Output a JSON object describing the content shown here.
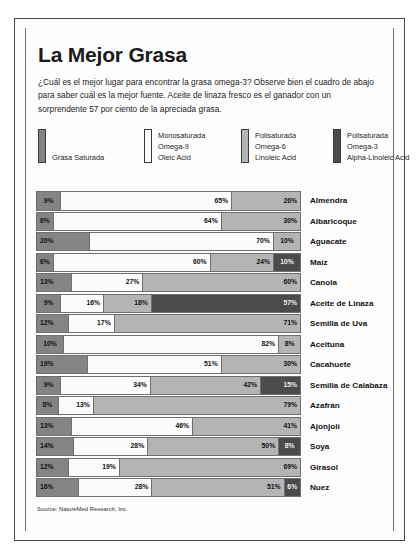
{
  "poster": {
    "title": "La Mejor Grasa",
    "deck": "¿Cuál es el mejor lugar para encontrar la grasa omega-3? Observe bien el cuadro de abajo para saber cuál es la mejor fuente. Aceite de linaza fresco es el ganador con un sorprendente 57 por ciento de la apreciada grasa.",
    "source": "Source: NatureMed Research, Inc."
  },
  "legend": [
    {
      "key": "saturada",
      "color": "#848484",
      "lines": [
        "Grasa Saturada"
      ]
    },
    {
      "key": "omega9",
      "color": "#fbfbfb",
      "lines": [
        "Monosaturada",
        "Omega-9",
        "Oleic Acid"
      ]
    },
    {
      "key": "omega6",
      "color": "#b4b4b4",
      "lines": [
        "Polisaturada",
        "Omega-6",
        "Linoleic Acid"
      ]
    },
    {
      "key": "omega3",
      "color": "#4b4b4b",
      "lines": [
        "Polisaturada",
        "Omega-3",
        "Alpha-Linoleic Acid"
      ]
    }
  ],
  "chart_data": {
    "type": "bar",
    "subtype": "stacked-horizontal-100",
    "title": "La Mejor Grasa",
    "xlabel": "",
    "ylabel": "",
    "xlim": [
      0,
      100
    ],
    "grid": false,
    "legend_position": "top",
    "categories": [
      "Almendra",
      "Albaricoque",
      "Aguacate",
      "Maíz",
      "Canola",
      "Aceite de Linaza",
      "Semilla de Uva",
      "Aceituna",
      "Cacahuete",
      "Semilla de Calabaza",
      "Azafrán",
      "Ajonjolí",
      "Soya",
      "Girasol",
      "Nuez"
    ],
    "series": [
      {
        "name": "Grasa Saturada",
        "key": "saturada",
        "color": "#848484",
        "values": [
          9,
          6,
          20,
          6,
          13,
          9,
          12,
          10,
          19,
          9,
          8,
          13,
          14,
          12,
          16
        ]
      },
      {
        "name": "Monosaturada Omega-9",
        "key": "omega9",
        "color": "#fbfbfb",
        "values": [
          65,
          64,
          70,
          60,
          27,
          16,
          17,
          82,
          51,
          34,
          13,
          46,
          28,
          19,
          28
        ]
      },
      {
        "name": "Polisaturada Omega-6",
        "key": "omega6",
        "color": "#b4b4b4",
        "values": [
          26,
          30,
          10,
          24,
          60,
          18,
          71,
          8,
          30,
          42,
          79,
          41,
          50,
          69,
          51
        ]
      },
      {
        "name": "Polisaturada Omega-3",
        "key": "omega3",
        "color": "#4b4b4b",
        "values": [
          0,
          0,
          0,
          10,
          0,
          57,
          0,
          0,
          0,
          15,
          0,
          0,
          8,
          0,
          6
        ]
      }
    ],
    "rows": [
      {
        "label": "Almendra",
        "segments": [
          {
            "k": "saturada",
            "v": 9,
            "t": "9%"
          },
          {
            "k": "omega9",
            "v": 65,
            "t": "65%"
          },
          {
            "k": "omega6",
            "v": 26,
            "t": "26%"
          }
        ]
      },
      {
        "label": "Albaricoque",
        "segments": [
          {
            "k": "saturada",
            "v": 6,
            "t": "6%"
          },
          {
            "k": "omega9",
            "v": 64,
            "t": "64%"
          },
          {
            "k": "omega6",
            "v": 30,
            "t": "30%"
          }
        ]
      },
      {
        "label": "Aguacate",
        "segments": [
          {
            "k": "saturada",
            "v": 20,
            "t": "20%"
          },
          {
            "k": "omega9",
            "v": 70,
            "t": "70%"
          },
          {
            "k": "omega6",
            "v": 10,
            "t": "10%"
          }
        ]
      },
      {
        "label": "Maíz",
        "segments": [
          {
            "k": "saturada",
            "v": 6,
            "t": "6%"
          },
          {
            "k": "omega9",
            "v": 60,
            "t": "60%"
          },
          {
            "k": "omega6",
            "v": 24,
            "t": "24%"
          },
          {
            "k": "omega3",
            "v": 10,
            "t": "10%"
          }
        ]
      },
      {
        "label": "Canola",
        "segments": [
          {
            "k": "saturada",
            "v": 13,
            "t": "13%"
          },
          {
            "k": "omega9",
            "v": 27,
            "t": "27%"
          },
          {
            "k": "omega6",
            "v": 60,
            "t": "60%"
          }
        ]
      },
      {
        "label": "Aceite de Linaza",
        "segments": [
          {
            "k": "saturada",
            "v": 9,
            "t": "9%"
          },
          {
            "k": "omega9",
            "v": 16,
            "t": "16%"
          },
          {
            "k": "omega6",
            "v": 18,
            "t": "18%"
          },
          {
            "k": "omega3",
            "v": 57,
            "t": "57%"
          }
        ]
      },
      {
        "label": "Semilla de Uva",
        "segments": [
          {
            "k": "saturada",
            "v": 12,
            "t": "12%"
          },
          {
            "k": "omega9",
            "v": 17,
            "t": "17%"
          },
          {
            "k": "omega6",
            "v": 71,
            "t": "71%"
          }
        ]
      },
      {
        "label": "Aceituna",
        "segments": [
          {
            "k": "saturada",
            "v": 10,
            "t": "10%"
          },
          {
            "k": "omega9",
            "v": 82,
            "t": "82%"
          },
          {
            "k": "omega6",
            "v": 8,
            "t": "8%"
          }
        ]
      },
      {
        "label": "Cacahuete",
        "segments": [
          {
            "k": "saturada",
            "v": 19,
            "t": "19%"
          },
          {
            "k": "omega9",
            "v": 51,
            "t": "51%"
          },
          {
            "k": "omega6",
            "v": 30,
            "t": "30%"
          }
        ]
      },
      {
        "label": "Semilla de Calabaza",
        "segments": [
          {
            "k": "saturada",
            "v": 9,
            "t": "9%"
          },
          {
            "k": "omega9",
            "v": 34,
            "t": "34%"
          },
          {
            "k": "omega6",
            "v": 42,
            "t": "42%"
          },
          {
            "k": "omega3",
            "v": 15,
            "t": "15%"
          }
        ]
      },
      {
        "label": "Azafrán",
        "segments": [
          {
            "k": "saturada",
            "v": 8,
            "t": "8%"
          },
          {
            "k": "omega9",
            "v": 13,
            "t": "13%"
          },
          {
            "k": "omega6",
            "v": 79,
            "t": "79%"
          }
        ]
      },
      {
        "label": "Ajonjolí",
        "segments": [
          {
            "k": "saturada",
            "v": 13,
            "t": "13%"
          },
          {
            "k": "omega9",
            "v": 46,
            "t": "46%"
          },
          {
            "k": "omega6",
            "v": 41,
            "t": "41%"
          }
        ]
      },
      {
        "label": "Soya",
        "segments": [
          {
            "k": "saturada",
            "v": 14,
            "t": "14%"
          },
          {
            "k": "omega9",
            "v": 28,
            "t": "28%"
          },
          {
            "k": "omega6",
            "v": 50,
            "t": "50%"
          },
          {
            "k": "omega3",
            "v": 8,
            "t": "8%"
          }
        ]
      },
      {
        "label": "Girasol",
        "segments": [
          {
            "k": "saturada",
            "v": 12,
            "t": "12%"
          },
          {
            "k": "omega9",
            "v": 19,
            "t": "19%"
          },
          {
            "k": "omega6",
            "v": 69,
            "t": "69%"
          }
        ]
      },
      {
        "label": "Nuez",
        "segments": [
          {
            "k": "saturada",
            "v": 16,
            "t": "16%"
          },
          {
            "k": "omega9",
            "v": 28,
            "t": "28%"
          },
          {
            "k": "omega6",
            "v": 51,
            "t": "51%"
          },
          {
            "k": "omega3",
            "v": 6,
            "t": "6%"
          }
        ]
      }
    ]
  }
}
